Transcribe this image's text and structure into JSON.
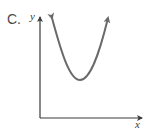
{
  "figure": {
    "option_label": "C.",
    "y_axis_label": "y",
    "x_axis_label": "x",
    "curve": "upward-opening parabola with arrows at both ends",
    "colors": {
      "axis": "#3a3a3a",
      "curve": "#6a6a6a",
      "text": "#4a4a4a"
    }
  }
}
